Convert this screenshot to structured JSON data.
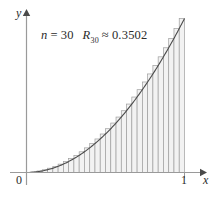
{
  "figure": {
    "annotation_n_label": "n",
    "annotation_n_eq": "=",
    "annotation_n_value": "30",
    "annotation_r_label": "R",
    "annotation_r_sub": "30",
    "annotation_approx": "≈",
    "annotation_r_value": "0.3502",
    "axis_label_x": "x",
    "axis_label_y": "y",
    "tick_label_origin": "0",
    "tick_label_right": "1",
    "colors": {
      "axis": "#9a9a9a",
      "curve": "#4a4a4a",
      "bar_stroke": "#9e9e9e",
      "bar_fill": "#f2f2f2",
      "text": "#2b2b2b",
      "background": "#ffffff"
    }
  },
  "chart_data": {
    "type": "area",
    "title": "",
    "subtitle": "",
    "xlabel": "x",
    "ylabel": "y",
    "xlim": [
      0,
      1
    ],
    "ylim": [
      0,
      1
    ],
    "grid": false,
    "legend": "none",
    "annotations": [
      "n = 30",
      "R_30 ≈ 0.3502"
    ],
    "xticks": [
      0,
      1
    ],
    "xticklabels": [
      "0",
      "1"
    ],
    "yticks": [],
    "yticklabels": [],
    "curve": {
      "name": "f(x) = x^2",
      "x": [
        0,
        0.05,
        0.1,
        0.15,
        0.2,
        0.25,
        0.3,
        0.35,
        0.4,
        0.45,
        0.5,
        0.55,
        0.6,
        0.65,
        0.7,
        0.75,
        0.8,
        0.85,
        0.9,
        0.95,
        1
      ],
      "y": [
        0,
        0.0025,
        0.01,
        0.0225,
        0.04,
        0.0625,
        0.09,
        0.1225,
        0.16,
        0.2025,
        0.25,
        0.3025,
        0.36,
        0.4225,
        0.49,
        0.5625,
        0.64,
        0.7225,
        0.81,
        0.9025,
        1
      ]
    },
    "riemann": {
      "n": 30,
      "rule": "right-endpoint",
      "sum": 0.3502,
      "interval": [
        0,
        1
      ],
      "bar_width": 0.0333333,
      "right_endpoints": [
        0.033333,
        0.066667,
        0.1,
        0.133333,
        0.166667,
        0.2,
        0.233333,
        0.266667,
        0.3,
        0.333333,
        0.366667,
        0.4,
        0.433333,
        0.466667,
        0.5,
        0.533333,
        0.566667,
        0.6,
        0.633333,
        0.666667,
        0.7,
        0.733333,
        0.766667,
        0.8,
        0.833333,
        0.866667,
        0.9,
        0.933333,
        0.966667,
        1
      ],
      "heights": [
        0.001111,
        0.004444,
        0.01,
        0.017778,
        0.027778,
        0.04,
        0.054444,
        0.071111,
        0.09,
        0.111111,
        0.134444,
        0.16,
        0.187778,
        0.217778,
        0.25,
        0.284444,
        0.321111,
        0.36,
        0.401111,
        0.444444,
        0.49,
        0.537778,
        0.587778,
        0.64,
        0.694444,
        0.751111,
        0.81,
        0.871111,
        0.934444,
        1
      ]
    }
  }
}
